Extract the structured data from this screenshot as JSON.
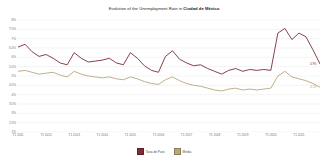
{
  "chart_data": {
    "type": "line",
    "title": "Evolution of the Unemployment Rate in Ciudad de México",
    "title_plain": "Evolution of the Unemployment Rate in ",
    "title_bold": "Ciudad de México",
    "xlabel": "",
    "ylabel": "",
    "grid": true,
    "legend_position": "bottom",
    "ylim": [
      2,
      8
    ],
    "ytick_labels": [
      "8%",
      "7.5%",
      "7%",
      "6.5%",
      "6%",
      "5.5%",
      "5%",
      "4.5%",
      "4%",
      "3.5%",
      "3%",
      "2.5%",
      "2%"
    ],
    "ytick_values": [
      8,
      7.5,
      7,
      6.5,
      6,
      5.5,
      5,
      4.5,
      4,
      3.5,
      3,
      2.5,
      2
    ],
    "xtick_labels": [
      "T1 2011",
      "T1 2012",
      "T1 2013",
      "T1 2014",
      "T1 2015",
      "T1 2016",
      "T1 2017",
      "T1 2018",
      "T1 2019",
      "T1 2020",
      "T1 2021"
    ],
    "xtick_positions": [
      0,
      4,
      8,
      12,
      16,
      20,
      24,
      28,
      32,
      36,
      40
    ],
    "x": [
      0,
      1,
      2,
      3,
      4,
      5,
      6,
      7,
      8,
      9,
      10,
      11,
      12,
      13,
      14,
      15,
      16,
      17,
      18,
      19,
      20,
      21,
      22,
      23,
      24,
      25,
      26,
      27,
      28,
      29,
      30,
      31,
      32,
      33,
      34,
      35,
      36,
      37,
      38,
      39,
      40,
      41,
      42,
      43
    ],
    "series": [
      {
        "name": "Tasa de Paro",
        "color": "#7B2D3B",
        "end_label": "4.9%",
        "values": [
          6.55,
          6.7,
          6.3,
          6.05,
          6.15,
          5.95,
          5.7,
          5.6,
          6.25,
          5.95,
          5.75,
          5.8,
          5.85,
          5.95,
          5.7,
          5.6,
          6.25,
          5.95,
          5.55,
          5.3,
          5.2,
          6.05,
          6.35,
          5.9,
          5.7,
          5.55,
          5.6,
          5.4,
          5.25,
          5.1,
          5.3,
          5.4,
          5.25,
          5.35,
          5.3,
          5.35,
          5.3,
          7.3,
          7.55,
          6.95,
          7.3,
          7.1,
          6.4,
          5.65
        ]
      },
      {
        "name": "Media",
        "color": "#B7A77A",
        "end_label": "4.1%",
        "values": [
          5.25,
          5.3,
          5.2,
          5.1,
          5.15,
          5.2,
          5.05,
          4.95,
          5.25,
          5.1,
          5.0,
          4.95,
          4.9,
          4.95,
          4.85,
          4.8,
          4.95,
          4.85,
          4.7,
          4.6,
          4.55,
          4.8,
          4.95,
          4.75,
          4.6,
          4.5,
          4.45,
          4.35,
          4.25,
          4.2,
          4.3,
          4.35,
          4.25,
          4.3,
          4.25,
          4.3,
          4.35,
          5.0,
          5.25,
          4.95,
          4.85,
          4.75,
          4.6,
          4.4
        ]
      }
    ]
  }
}
